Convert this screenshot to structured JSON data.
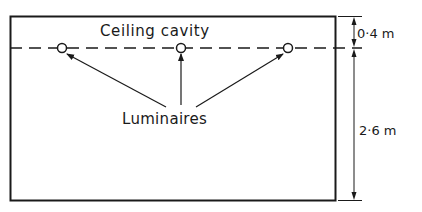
{
  "diagram": {
    "labels": {
      "ceiling_cavity": "Ceiling cavity",
      "luminaires": "Luminaires",
      "cavity_height": "0·4 m",
      "room_height": "2·6 m"
    },
    "luminaire_count": 3,
    "colors": {
      "ink": "#1a1a1a",
      "background": "#ffffff"
    }
  }
}
